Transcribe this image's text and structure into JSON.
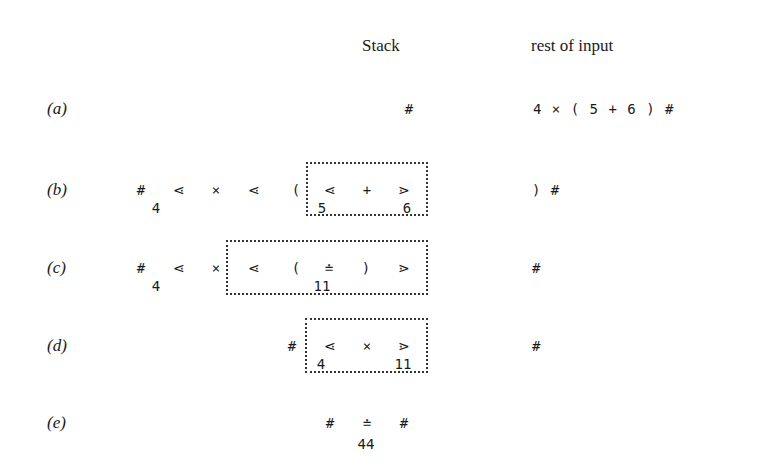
{
  "headers": {
    "stack": "Stack",
    "rest_of_input": "rest of input"
  },
  "rows": [
    {
      "label": "(a)",
      "stack_symbols": [
        "#"
      ],
      "stack_values": [],
      "input": "4 × ( 5 + 6 ) #"
    },
    {
      "label": "(b)",
      "stack_symbols": [
        "#",
        "⋖",
        "×",
        "⋖",
        "(",
        "⋖",
        "+",
        "⋗"
      ],
      "stack_values": [
        "4",
        "5",
        "6"
      ],
      "input": ") #",
      "box": {
        "contains": [
          "⋖",
          "+",
          "⋗",
          "5",
          "6"
        ]
      }
    },
    {
      "label": "(c)",
      "stack_symbols": [
        "#",
        "⋖",
        "×",
        "⋖",
        "(",
        "≐",
        ")",
        "⋗"
      ],
      "stack_values": [
        "4",
        "11"
      ],
      "input": "#",
      "box": {
        "contains": [
          "⋖",
          "(",
          "≐",
          ")",
          "⋗",
          "11"
        ]
      }
    },
    {
      "label": "(d)",
      "stack_symbols": [
        "#",
        "⋖",
        "×",
        "⋗"
      ],
      "stack_values": [
        "4",
        "11"
      ],
      "input": "#",
      "box": {
        "contains": [
          "⋖",
          "×",
          "⋗",
          "4",
          "11"
        ]
      }
    },
    {
      "label": "(e)",
      "stack_symbols": [
        "#",
        "≐",
        "#"
      ],
      "stack_values": [
        "44"
      ],
      "input": ""
    }
  ]
}
